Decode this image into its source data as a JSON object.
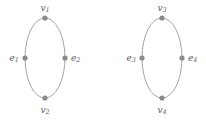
{
  "figure": {
    "background_color": "#ffffff",
    "stroke_color": "#9a9a9a",
    "dot_color": "#8a8a8a",
    "label_color": "#5e5e5e",
    "graphs": [
      {
        "name": "left-graph",
        "center_x": 45,
        "center_y": 58,
        "radius_x": 20,
        "radius_y": 40,
        "vertices": [
          {
            "name": "vertex-v1",
            "position": "top",
            "cx": 45,
            "cy": 18,
            "r": 2.6,
            "label_base": "v",
            "label_sub": "1",
            "label_x": 45,
            "label_y": 8,
            "label_anchor": "middle"
          },
          {
            "name": "vertex-v2",
            "position": "bottom",
            "cx": 45,
            "cy": 98,
            "r": 2.6,
            "label_base": "v",
            "label_sub": "2",
            "label_x": 45,
            "label_y": 110,
            "label_anchor": "middle"
          },
          {
            "name": "vertex-e1",
            "position": "left",
            "cx": 25,
            "cy": 58,
            "r": 2.6,
            "label_base": "e",
            "label_sub": "1",
            "label_x": 19,
            "label_y": 58,
            "label_anchor": "end"
          },
          {
            "name": "vertex-e2",
            "position": "right",
            "cx": 65,
            "cy": 58,
            "r": 2.6,
            "label_base": "e",
            "label_sub": "2",
            "label_x": 71,
            "label_y": 58,
            "label_anchor": "start"
          }
        ]
      },
      {
        "name": "right-graph",
        "center_x": 162,
        "center_y": 58,
        "radius_x": 20,
        "radius_y": 40,
        "vertices": [
          {
            "name": "vertex-v3",
            "position": "top",
            "cx": 162,
            "cy": 18,
            "r": 2.6,
            "label_base": "v",
            "label_sub": "3",
            "label_x": 162,
            "label_y": 8,
            "label_anchor": "middle"
          },
          {
            "name": "vertex-v4",
            "position": "bottom",
            "cx": 162,
            "cy": 98,
            "r": 2.6,
            "label_base": "v",
            "label_sub": "4",
            "label_x": 162,
            "label_y": 110,
            "label_anchor": "middle"
          },
          {
            "name": "vertex-e3",
            "position": "left",
            "cx": 142,
            "cy": 58,
            "r": 2.6,
            "label_base": "e",
            "label_sub": "3",
            "label_x": 136,
            "label_y": 58,
            "label_anchor": "end"
          },
          {
            "name": "vertex-e4",
            "position": "right",
            "cx": 182,
            "cy": 58,
            "r": 2.6,
            "label_base": "e",
            "label_sub": "4",
            "label_x": 188,
            "label_y": 58,
            "label_anchor": "start"
          }
        ]
      }
    ]
  }
}
